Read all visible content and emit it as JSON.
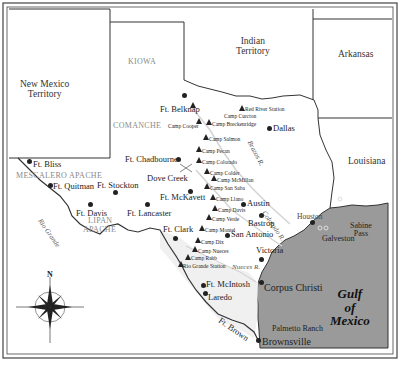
{
  "regions": {
    "new_mexico": "New Mexico\nTerritory",
    "indian_territory": "Indian\nTerritory",
    "arkansas": "Arkansas",
    "louisiana": "Louisiana",
    "gulf": [
      "Gulf",
      "of",
      "Mexico"
    ]
  },
  "tribes": {
    "kiowa": "KIOWA",
    "comanche": "COMANCHE",
    "mescalero": "MESCALERO APACHE",
    "lipan_1": "LIPAN",
    "lipan_2": "APACHE"
  },
  "rivers": {
    "rio_grande": "Rio Grande",
    "brazos": "Brazos R.",
    "colorado": "Colorado R.",
    "nueces": "Nueces R."
  },
  "forts": {
    "belknap": "Ft. Belknap",
    "chadbourne": "Ft. Chadbourne",
    "bliss": "Ft. Bliss",
    "quitman": "Ft. Quitman",
    "stockton": "Ft. Stockton",
    "davis": "Ft. Davis",
    "lancaster": "Ft. Lancaster",
    "mckavett": "Ft. McKavett",
    "clark": "Ft. Clark",
    "mcintosh": "Ft. McIntosh",
    "brown": "Ft. Brown"
  },
  "camps": {
    "red_river": "Red River Station",
    "curcton": "Camp Curcton",
    "cooper": "Camp Cooper",
    "breckenridge": "Camp Breckenridge",
    "salmon": "Camp Salmon",
    "pecan": "Camp Pecan",
    "colorado": "Camp Colorado",
    "colder": "Camp Colder",
    "mcmillan": "Camp McMillan",
    "san_saba": "Camp San Saba",
    "llano": "Camp Llano",
    "davis": "Camp Davis",
    "verde": "Camp Verde",
    "montel": "Camp Montel",
    "dix": "Camp Dix",
    "nueces": "Camp Nueces",
    "rabb": "Camp Rabb",
    "rio_grande_station": "Rio Grande Station"
  },
  "cities": {
    "dallas": "Dallas",
    "austin": "Austin",
    "bastrop": "Bastrop",
    "san_antonio": "San Antonio",
    "houston": "Houston",
    "victoria": "Victoria",
    "galveston": "Galveston",
    "sabine_pass": "Sabine\nPass",
    "corpus_christi": "Corpus Christi",
    "laredo": "Laredo",
    "brownsville": "Brownsville",
    "palmetto_ranch": "Palmetto Ranch",
    "dove_creek": "Dove Creek"
  },
  "compass": {
    "north": "N"
  },
  "colors": {
    "gulf": "#9a9a9a",
    "border": "#333333",
    "land": "#ffffff",
    "tribe": "#8a8a8a",
    "river": "#d8d8d8"
  }
}
